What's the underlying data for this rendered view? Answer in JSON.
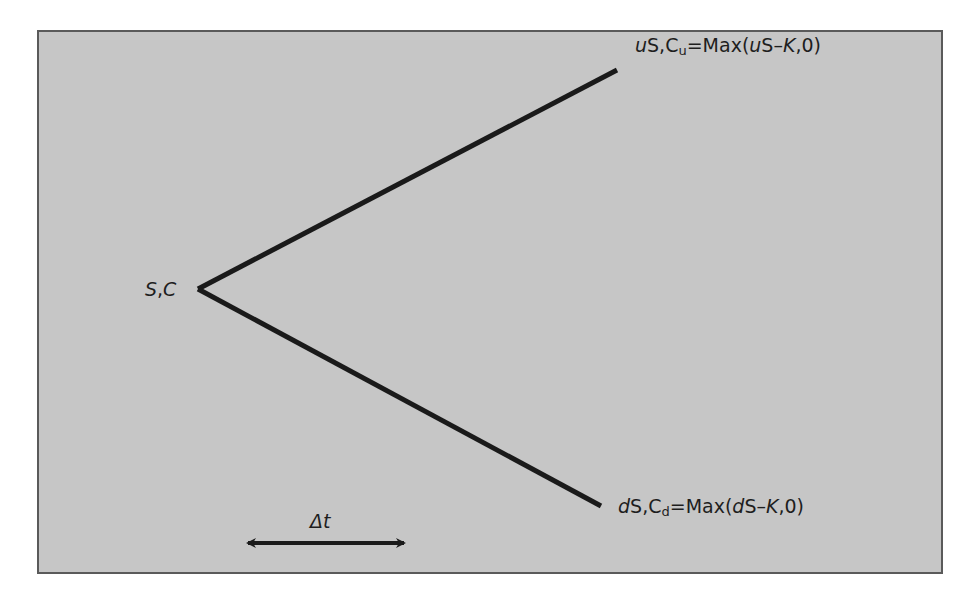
{
  "diagram": {
    "type": "one-step binomial tree",
    "root": {
      "label_S": "S",
      "sep": ",",
      "label_C": "C"
    },
    "up_node": {
      "prefix": "u",
      "S": "S",
      "sep": ",",
      "C": "C",
      "sub": "u",
      "eq": "=Max(",
      "arg_prefix": "u",
      "arg_S": "S",
      "minus": "–",
      "K": "K",
      "tail": ",0)"
    },
    "down_node": {
      "prefix": "d",
      "S": "S",
      "sep": ",",
      "C": "C",
      "sub": "d",
      "eq": "=Max(",
      "arg_prefix": "d",
      "arg_S": "S",
      "minus": "–",
      "K": "K",
      "tail": ",0)"
    },
    "time_step": {
      "delta": "Δ",
      "t": "t"
    },
    "colors": {
      "panel": "#c6c6c6",
      "border": "#5a5a5a",
      "line": "#1a1a1a",
      "text": "#1e1e1e"
    }
  }
}
